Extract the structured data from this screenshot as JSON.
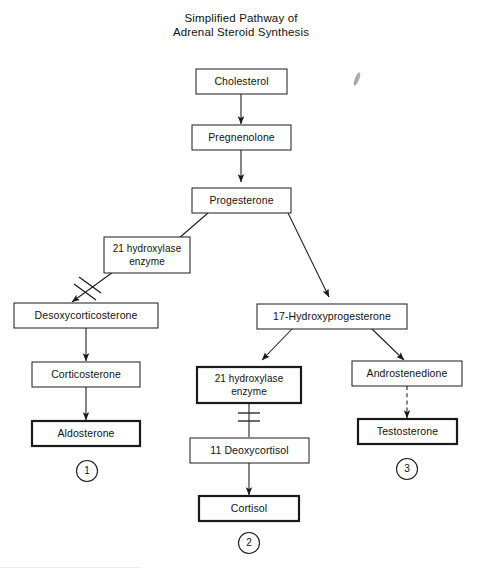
{
  "title": {
    "line1": "Simplified Pathway of",
    "line2": "Adrenal Steroid Synthesis"
  },
  "nodes": {
    "cholesterol": "Cholesterol",
    "pregnenolone": "Pregnenolone",
    "progesterone": "Progesterone",
    "enzyme_left_line1": "21 hydroxylase",
    "enzyme_left_line2": "enzyme",
    "desoxycorticosterone": "Desoxycorticosterone",
    "corticosterone": "Corticosterone",
    "aldosterone": "Aldosterone",
    "hydroxyprogesterone": "17-Hydroxyprogesterone",
    "enzyme_mid_line1": "21 hydroxylase",
    "enzyme_mid_line2": "enzyme",
    "deoxycortisol": "11 Deoxycortisol",
    "cortisol": "Cortisol",
    "androstenedione": "Androstenedione",
    "testosterone": "Testosterone"
  },
  "markers": {
    "one": "1",
    "two": "2",
    "three": "3"
  },
  "caption": {
    "sliver": "................................................................................"
  },
  "colors": {
    "stroke": "#1a1a1a",
    "background": "#ffffff",
    "text": "#111111"
  }
}
